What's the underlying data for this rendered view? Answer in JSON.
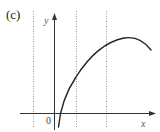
{
  "panel_label": "(c)",
  "axes": {
    "x_label": "x",
    "y_label": "y",
    "origin_label": "0"
  },
  "colors": {
    "axis": "#333333",
    "curve": "#222222",
    "guide": "#999999"
  },
  "guides": {
    "count": 3,
    "style": "dotted vertical lines"
  },
  "curve": {
    "description": "concave-down curve rising steeply from below the x-axis just right of the origin, peaking near the upper right, then descending slightly"
  }
}
